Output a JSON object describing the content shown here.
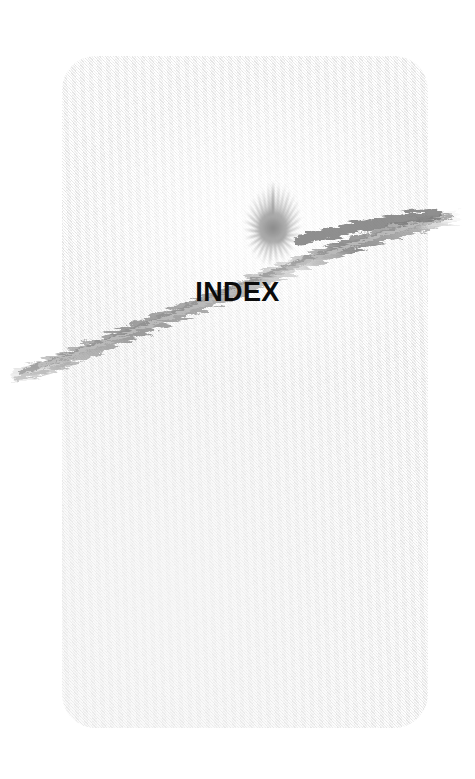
{
  "page": {
    "kind": "book-section-divider",
    "title": "INDEX",
    "background_color": "#ffffff",
    "card": {
      "fill_color": "#f2f2f2",
      "highlight_color": "#fbfbfb",
      "corner_radius_px": 34,
      "left_px": 62,
      "top_px": 56,
      "width_px": 366,
      "height_px": 672,
      "texture": "woven-paper-diagonal"
    }
  },
  "artwork": {
    "brush_stroke": {
      "name": "swoosh",
      "color": "#8c8c8c",
      "secondary_color": "#b4b4b4",
      "description": "dry-brush arc sweeping from lower-left off-page, up through the starburst and off the right edge",
      "start_point": [
        18,
        372
      ],
      "control_point": [
        168,
        318
      ],
      "end_point": [
        452,
        216
      ]
    },
    "starburst": {
      "name": "starburst",
      "color": "#9a9a9a",
      "core_color": "#8f8f8f",
      "center": [
        273,
        228
      ],
      "outer_radius_px": 47,
      "inner_radius_px": 13,
      "spike_count": 26
    }
  },
  "title_block": {
    "text": "INDEX",
    "color": "#0b0b0b",
    "font_weight": "bold",
    "font_size_px": 27,
    "center_x_px": 247,
    "baseline_y_px": 305
  }
}
